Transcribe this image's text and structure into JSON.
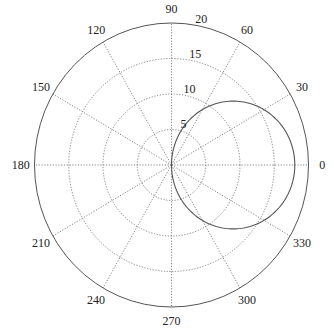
{
  "chart_data": {
    "type": "polar_line",
    "title": "",
    "theta_unit": "degrees",
    "angle_ticks": [
      0,
      30,
      60,
      90,
      120,
      150,
      180,
      210,
      240,
      270,
      300,
      330
    ],
    "angle_tick_labels": [
      "0",
      "30",
      "60",
      "90",
      "120",
      "150",
      "180",
      "210",
      "240",
      "270",
      "300",
      "330"
    ],
    "radial_ticks": [
      5,
      10,
      15,
      20
    ],
    "radial_tick_labels": [
      "5",
      "10",
      "15",
      "20"
    ],
    "rlim": [
      0,
      20
    ],
    "radial_label_angle_deg": 80,
    "grid": true,
    "grid_style": "dotted",
    "series": [
      {
        "name": "r = 18 cos(theta)",
        "equation": "r = 18*cos(theta)",
        "theta_deg": [
          -90,
          -75,
          -60,
          -45,
          -30,
          -15,
          0,
          15,
          30,
          45,
          60,
          75,
          90
        ],
        "r": [
          0,
          4.66,
          9.0,
          12.73,
          15.59,
          17.39,
          18.0,
          17.39,
          15.59,
          12.73,
          9.0,
          4.66,
          0
        ],
        "color": "#555555"
      }
    ]
  },
  "colors": {
    "axis": "#555555",
    "grid": "#666666",
    "text": "#222222"
  }
}
